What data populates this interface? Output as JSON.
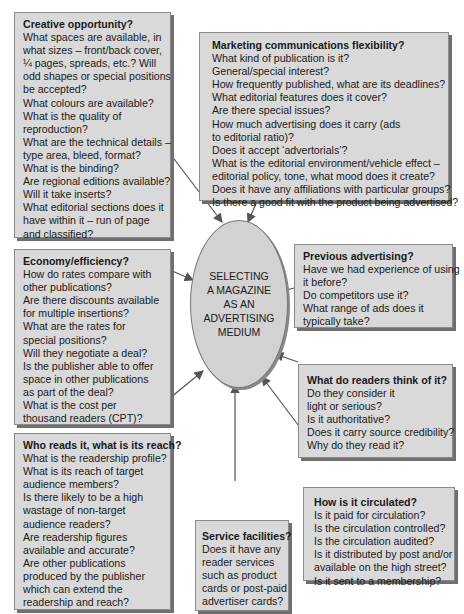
{
  "center": {
    "lines": [
      "SELECTING",
      "A MAGAZINE",
      "AS AN",
      "ADVERTISING",
      "MEDIUM"
    ]
  },
  "boxes": {
    "creative": {
      "title": "Creative opportunity?",
      "lines": [
        "What spaces are available, in",
        "what sizes – front/back cover,",
        "¼ pages, spreads, etc.? Will",
        "odd shapes or special positions",
        "be accepted?",
        "What colours are available?",
        "What is the quality of",
        "reproduction?",
        "What are the technical details –",
        "type area, bleed, format?",
        "What is the binding?",
        "Are regional editions available?",
        "Will it take inserts?",
        "What editorial sections does it",
        "have within it – run of page",
        "and classified?"
      ]
    },
    "marketing": {
      "title": "Marketing communications flexibility?",
      "lines": [
        "What kind of publication is it?",
        "General/special interest?",
        "How frequently published, what are its deadlines?",
        "What editorial features does it cover?",
        "Are there special issues?",
        "How much advertising does it carry (ads",
        "to editorial ratio)?",
        "Does it accept ‘advertorials’?",
        "What is the editorial environment/vehicle effect –",
        "editorial policy, tone, what mood does it create?",
        "Does it have any affiliations with particular groups?",
        "Is there a good fit with the product being advertised?"
      ]
    },
    "economy": {
      "title": "Economy/efficiency?",
      "lines": [
        "How do rates compare with",
        "other publications?",
        "Are there discounts available",
        "for multiple insertions?",
        "What are the rates for",
        "special positions?",
        "Will they negotiate a deal?",
        "Is the publisher able to offer",
        "space in other publications",
        "as part of the deal?",
        "What is the cost per",
        "thousand readers (CPT)?"
      ]
    },
    "previous": {
      "title": "Previous advertising?",
      "lines": [
        "Have we had experience of using",
        "it before?",
        "Do competitors use it?",
        "What range of ads does it",
        "typically take?"
      ]
    },
    "readers": {
      "title": "What do readers think of it?",
      "lines": [
        "Do they consider it",
        "light or serious?",
        "Is it authoritative?",
        "Does it carry source credibility?",
        "Why do they read it?"
      ]
    },
    "who": {
      "title": "Who reads it, what is its reach?",
      "lines": [
        "What is the readership profile?",
        "What is its reach of target",
        "audience members?",
        "Is there likely to be a high",
        "wastage of non-target",
        "audience readers?",
        "Are readership figures",
        "available and accurate?",
        "Are other publications",
        "produced by the publisher",
        "which can extend the",
        "readership and reach?"
      ]
    },
    "service": {
      "title": "Service facilities?",
      "lines": [
        "Does it have any",
        "reader services",
        "such as product",
        "cards or post-paid",
        "advertiser cards?"
      ]
    },
    "circulated": {
      "title": "How is it circulated?",
      "lines": [
        "Is it paid for circulation?",
        "Is the circulation controlled?",
        "Is the circulation audited?",
        "Is it distributed by post and/or",
        "available on the high street?",
        "Is it sent to a membership?"
      ]
    }
  },
  "colors": {
    "box_fill": "#d9d9d9",
    "ellipse_fill": "#d2d2d2",
    "arrow": "#555555"
  }
}
